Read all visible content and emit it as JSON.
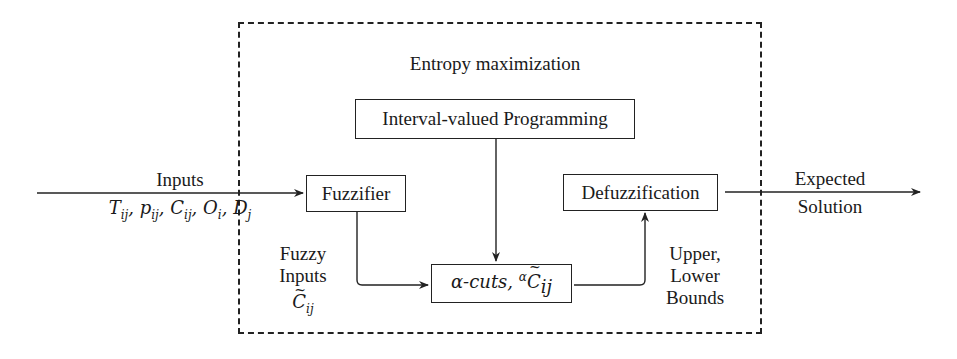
{
  "diagram": {
    "frame_title": "Entropy maximization",
    "boxes": {
      "interval_programming": "Interval-valued Programming",
      "fuzzifier": "Fuzzifier",
      "alpha_cuts_prefix": "α-cuts, ",
      "alpha_cuts_sup": "α",
      "alpha_cuts_var": "C",
      "alpha_cuts_sub": "ij",
      "defuzzification": "Defuzzification"
    },
    "inputs": {
      "label": "Inputs",
      "vars": [
        {
          "sym": "T",
          "sub": "ij"
        },
        {
          "sym": "p",
          "sub": "ij"
        },
        {
          "sym": "C",
          "sub": "ij"
        },
        {
          "sym": "O",
          "sub": "i"
        },
        {
          "sym": "D",
          "sub": "j"
        }
      ]
    },
    "fuzzy_inputs": {
      "line1": "Fuzzy",
      "line2": "Inputs",
      "var": "C",
      "sub": "ij"
    },
    "bounds": {
      "line1": "Upper,",
      "line2": "Lower",
      "line3": "Bounds"
    },
    "output": {
      "line1": "Expected",
      "line2": "Solution"
    },
    "colors": {
      "line": "#222222",
      "background": "#ffffff"
    }
  }
}
